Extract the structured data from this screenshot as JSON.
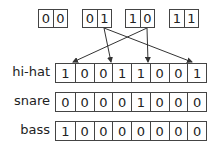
{
  "top_groups": [
    {
      "bits": [
        "0",
        "0"
      ]
    },
    {
      "bits": [
        "0",
        "1"
      ]
    },
    {
      "bits": [
        "1",
        "0"
      ]
    },
    {
      "bits": [
        "1",
        "1"
      ]
    }
  ],
  "rows": [
    {
      "label": "hi-hat",
      "bits": [
        "1",
        "0",
        "0",
        "1",
        "1",
        "0",
        "0",
        "1"
      ]
    },
    {
      "label": "snare",
      "bits": [
        "0",
        "0",
        "0",
        "0",
        "1",
        "0",
        "0",
        "0"
      ]
    },
    {
      "label": "bass",
      "bits": [
        "1",
        "0",
        "0",
        "0",
        "0",
        "0",
        "0",
        "0"
      ]
    }
  ],
  "arrows": [
    {
      "from_group": "01",
      "to_hihat_step": 3
    },
    {
      "from_group": "01",
      "to_hihat_step": 8
    },
    {
      "from_group": "10",
      "to_hihat_step": 1
    },
    {
      "from_group": "10",
      "to_hihat_step": 6
    }
  ]
}
